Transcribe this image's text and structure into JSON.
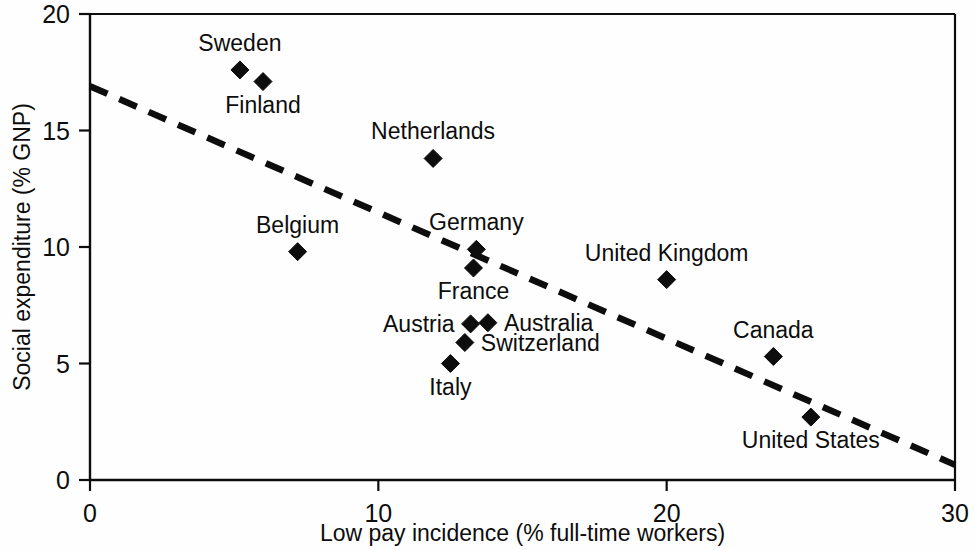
{
  "chart_data": {
    "type": "scatter",
    "title": "",
    "xlabel": "Low pay incidence (% full-time workers)",
    "ylabel": "Social expenditure (% GNP)",
    "xlim": [
      0,
      30
    ],
    "ylim": [
      0,
      20
    ],
    "xticks": [
      "0",
      "10",
      "20",
      "30"
    ],
    "xtick_values": [
      0,
      10,
      20,
      30
    ],
    "yticks": [
      "0",
      "5",
      "10",
      "15",
      "20"
    ],
    "ytick_values": [
      0,
      5,
      10,
      15,
      20
    ],
    "grid": false,
    "legend": "none",
    "marker_style": "filled-diamond",
    "points": [
      {
        "label": "Sweden",
        "x": 5.2,
        "y": 17.6,
        "label_pos": "above"
      },
      {
        "label": "Finland",
        "x": 6.0,
        "y": 17.1,
        "label_pos": "below"
      },
      {
        "label": "Netherlands",
        "x": 11.9,
        "y": 13.8,
        "label_pos": "above"
      },
      {
        "label": "Belgium",
        "x": 7.2,
        "y": 9.8,
        "label_pos": "above"
      },
      {
        "label": "Germany",
        "x": 13.4,
        "y": 9.9,
        "label_pos": "above"
      },
      {
        "label": "France",
        "x": 13.3,
        "y": 9.1,
        "label_pos": "below"
      },
      {
        "label": "United Kingdom",
        "x": 20.0,
        "y": 8.6,
        "label_pos": "above"
      },
      {
        "label": "Austria",
        "x": 13.2,
        "y": 6.7,
        "label_pos": "left"
      },
      {
        "label": "Australia",
        "x": 13.8,
        "y": 6.75,
        "label_pos": "right"
      },
      {
        "label": "Switzerland",
        "x": 13.0,
        "y": 5.9,
        "label_pos": "right"
      },
      {
        "label": "Canada",
        "x": 23.7,
        "y": 5.3,
        "label_pos": "above"
      },
      {
        "label": "Italy",
        "x": 12.5,
        "y": 5.0,
        "label_pos": "below"
      },
      {
        "label": "United States",
        "x": 25.0,
        "y": 2.7,
        "label_pos": "below"
      }
    ],
    "trend_line": {
      "style": "dashed",
      "x_start": 0,
      "y_start": 16.9,
      "x_end": 30,
      "y_end": 0.65
    }
  }
}
